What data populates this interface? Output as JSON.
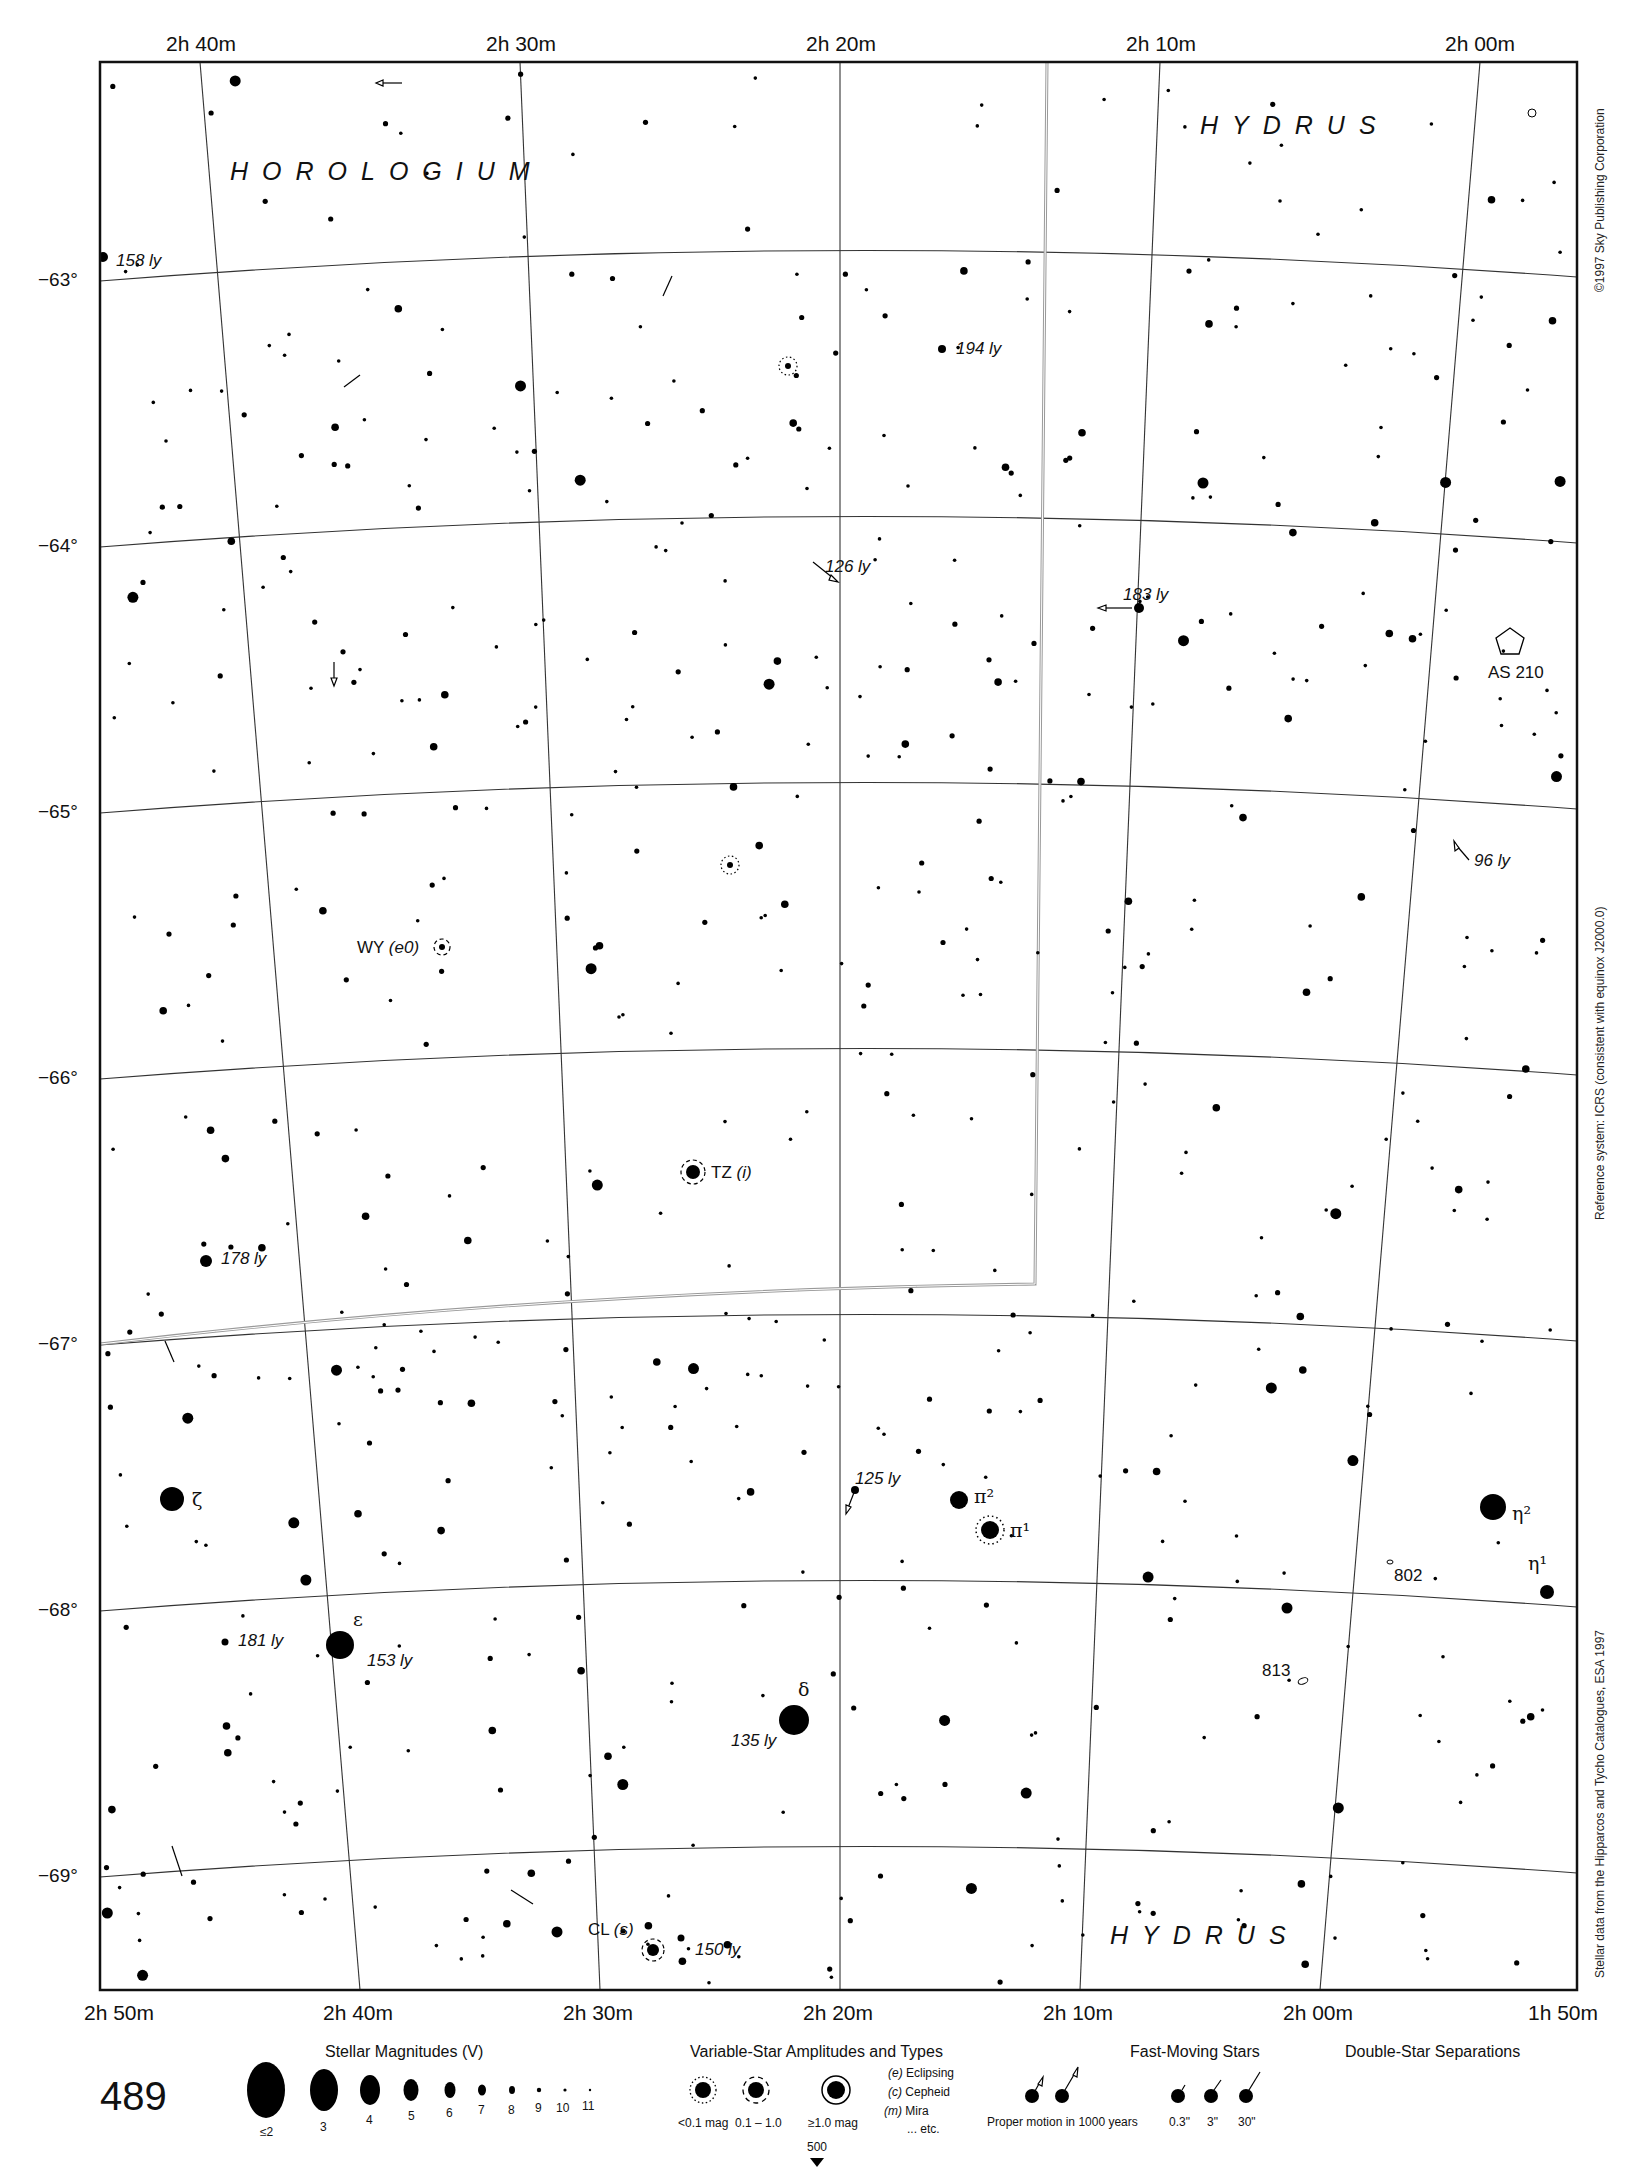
{
  "chart_data": {
    "type": "star-atlas-page",
    "page_number": "489",
    "next_page_ref": "500",
    "constellations": [
      "HOROLOGIUM",
      "HYDRUS",
      "HYDRUS"
    ],
    "ra_labels_top": [
      "2h 40m",
      "2h 30m",
      "2h 20m",
      "2h 10m",
      "2h 00m"
    ],
    "ra_labels_bottom": [
      "2h 50m",
      "2h 40m",
      "2h 30m",
      "2h 20m",
      "2h 10m",
      "2h 00m",
      "1h 50m"
    ],
    "dec_labels": [
      "−63°",
      "−64°",
      "−65°",
      "−66°",
      "−67°",
      "−68°",
      "−69°"
    ],
    "named_stars": [
      {
        "name": "ζ",
        "x": 172,
        "y": 1499,
        "mag": 4.9
      },
      {
        "name": "ε",
        "x": 340,
        "y": 1645,
        "mag": 4.9,
        "distance": "153 ly"
      },
      {
        "name": "δ",
        "x": 794,
        "y": 1720,
        "mag": 4.9,
        "distance": "135 ly"
      },
      {
        "name": "π²",
        "x": 959,
        "y": 1500,
        "mag": 5.7
      },
      {
        "name": "π¹",
        "x": 990,
        "y": 1530,
        "mag": 5.6,
        "variable": "<0.1 mag"
      },
      {
        "name": "η²",
        "x": 1493,
        "y": 1507,
        "mag": 4.7
      },
      {
        "name": "η¹",
        "x": 1547,
        "y": 1592,
        "mag": 6.8
      }
    ],
    "variable_stars": [
      {
        "name": "WY",
        "type": "(e0)",
        "x": 442,
        "y": 947
      },
      {
        "name": "TZ",
        "type": "(i)",
        "x": 693,
        "y": 1172
      },
      {
        "name": "CL",
        "type": "(s)",
        "x": 653,
        "y": 1950
      }
    ],
    "distance_labels": [
      {
        "text": "158 ly",
        "x": 116,
        "y": 266
      },
      {
        "text": "194 ly",
        "x": 956,
        "y": 354
      },
      {
        "text": "126 ly",
        "x": 825,
        "y": 572
      },
      {
        "text": "183 ly",
        "x": 1123,
        "y": 600
      },
      {
        "text": "96 ly",
        "x": 1474,
        "y": 866
      },
      {
        "text": "178 ly",
        "x": 221,
        "y": 1264
      },
      {
        "text": "125 ly",
        "x": 855,
        "y": 1484
      },
      {
        "text": "181 ly",
        "x": 238,
        "y": 1646
      },
      {
        "text": "153 ly",
        "x": 367,
        "y": 1666
      },
      {
        "text": "135 ly",
        "x": 731,
        "y": 1746
      },
      {
        "text": "150 ly",
        "x": 695,
        "y": 1955
      }
    ],
    "deep_sky": [
      {
        "name": "AS 210",
        "kind": "planetary/asterism",
        "x": 1510,
        "y": 640
      },
      {
        "name": "802",
        "kind": "galaxy",
        "x": 1380,
        "y": 1570
      },
      {
        "name": "813",
        "kind": "galaxy",
        "x": 1293,
        "y": 1675
      }
    ]
  },
  "side_notes": {
    "copyright": "©1997 Sky Publishing Corporation",
    "reference": "Reference system: ICRS (consistent with equinox J2000.0)",
    "source": "Stellar data from the Hipparcos and Tycho Catalogues, ESA 1997"
  },
  "legend": {
    "magnitudes": {
      "title": "Stellar Magnitudes (V)",
      "items": [
        "≤2",
        "3",
        "4",
        "5",
        "6",
        "7",
        "8",
        "9",
        "10",
        "11"
      ]
    },
    "variables": {
      "title": "Variable-Star Amplitudes and Types",
      "amplitudes": [
        "<0.1 mag",
        "0.1 – 1.0",
        "≥1.0 mag"
      ],
      "types": [
        {
          "code": "(e)",
          "label": "Eclipsing"
        },
        {
          "code": "(c)",
          "label": "Cepheid"
        },
        {
          "code": "(m)",
          "label": "Mira"
        },
        {
          "code": "",
          "label": "... etc."
        }
      ]
    },
    "fast_moving": {
      "title": "Fast-Moving Stars",
      "caption": "Proper motion in 1000 years"
    },
    "doubles": {
      "title": "Double-Star Separations",
      "items": [
        "0.3\"",
        "3\"",
        "30\""
      ]
    }
  }
}
